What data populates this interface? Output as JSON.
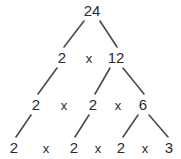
{
  "figure": {
    "background_color": "#ffffff",
    "text_color": "#2b2b2b",
    "edge_color": "#4a4a4a",
    "width": 181,
    "height": 159
  },
  "chart_data": {
    "type": "diagram",
    "diagram_kind": "factor-tree",
    "root_value": 24,
    "prime_factorization": "2 x 2 x 2 x 3",
    "levels": [
      {
        "level": 1,
        "nodes": [
          {
            "id": "n24",
            "label": "24",
            "value": 24,
            "x": 92,
            "y": 10,
            "prime": false
          }
        ],
        "operators": []
      },
      {
        "level": 2,
        "nodes": [
          {
            "id": "l2-a",
            "label": "2",
            "value": 2,
            "x": 62,
            "y": 57,
            "prime": true
          },
          {
            "id": "l2-b",
            "label": "12",
            "value": 12,
            "x": 116,
            "y": 57,
            "prime": false
          }
        ],
        "operators": [
          {
            "id": "op-l2-1",
            "label": "x",
            "x": 89,
            "y": 58
          }
        ]
      },
      {
        "level": 3,
        "nodes": [
          {
            "id": "l3-a",
            "label": "2",
            "value": 2,
            "x": 36,
            "y": 104,
            "prime": true
          },
          {
            "id": "l3-b",
            "label": "2",
            "value": 2,
            "x": 93,
            "y": 104,
            "prime": true
          },
          {
            "id": "l3-c",
            "label": "6",
            "value": 6,
            "x": 143,
            "y": 104,
            "prime": false
          }
        ],
        "operators": [
          {
            "id": "op-l3-1",
            "label": "x",
            "x": 64,
            "y": 105
          },
          {
            "id": "op-l3-2",
            "label": "x",
            "x": 118,
            "y": 105
          }
        ]
      },
      {
        "level": 4,
        "nodes": [
          {
            "id": "l4-a",
            "label": "2",
            "value": 2,
            "x": 14,
            "y": 147,
            "prime": true
          },
          {
            "id": "l4-b",
            "label": "2",
            "value": 2,
            "x": 74,
            "y": 147,
            "prime": true
          },
          {
            "id": "l4-c",
            "label": "2",
            "value": 2,
            "x": 121,
            "y": 147,
            "prime": true
          },
          {
            "id": "l4-d",
            "label": "3",
            "value": 3,
            "x": 169,
            "y": 147,
            "prime": true
          }
        ],
        "operators": [
          {
            "id": "op-l4-1",
            "label": "x",
            "x": 46,
            "y": 148
          },
          {
            "id": "op-l4-2",
            "label": "x",
            "x": 98,
            "y": 148
          },
          {
            "id": "op-l4-3",
            "label": "x",
            "x": 145,
            "y": 148
          }
        ]
      }
    ],
    "edges": [
      {
        "id": "e-24-2",
        "from": "n24",
        "to": "l2-a",
        "x1": 84,
        "y1": 21,
        "x2": 64,
        "y2": 47
      },
      {
        "id": "e-24-12",
        "from": "n24",
        "to": "l2-b",
        "x1": 100,
        "y1": 21,
        "x2": 117,
        "y2": 47
      },
      {
        "id": "e-2-2",
        "from": "l2-a",
        "to": "l3-a",
        "x1": 57,
        "y1": 68,
        "x2": 38,
        "y2": 94
      },
      {
        "id": "e-12-2",
        "from": "l2-b",
        "to": "l3-b",
        "x1": 110,
        "y1": 68,
        "x2": 95,
        "y2": 94
      },
      {
        "id": "e-12-6",
        "from": "l2-b",
        "to": "l3-c",
        "x1": 123,
        "y1": 68,
        "x2": 144,
        "y2": 94
      },
      {
        "id": "e-2-2b",
        "from": "l3-a",
        "to": "l4-a",
        "x1": 31,
        "y1": 115,
        "x2": 16,
        "y2": 137
      },
      {
        "id": "e-2-2c",
        "from": "l3-b",
        "to": "l4-b",
        "x1": 89,
        "y1": 115,
        "x2": 75,
        "y2": 137
      },
      {
        "id": "e-6-2",
        "from": "l3-c",
        "to": "l4-c",
        "x1": 138,
        "y1": 115,
        "x2": 123,
        "y2": 137
      },
      {
        "id": "e-6-3",
        "from": "l3-c",
        "to": "l4-d",
        "x1": 149,
        "y1": 115,
        "x2": 168,
        "y2": 137
      }
    ]
  }
}
